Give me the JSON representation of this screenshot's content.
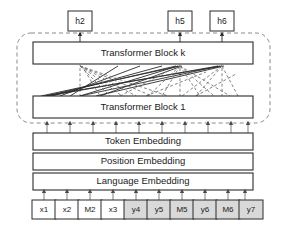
{
  "figure": {
    "background_color": "#ffffff"
  },
  "outputs": {
    "label_prefix": "h",
    "items": [
      {
        "label": "h2",
        "x": 80,
        "token_index": 2
      },
      {
        "label": "h5",
        "x": 180,
        "token_index": 5
      },
      {
        "label": "h6",
        "x": 222,
        "token_index": 8
      }
    ]
  },
  "transformer_stack": {
    "dashed_region_label": "",
    "top_block": {
      "label": "Transformer Block k"
    },
    "bottom_block": {
      "label": "Transformer Block 1"
    },
    "ellipsis_between": true
  },
  "embeddings": {
    "layers": [
      {
        "label": "Token Embedding"
      },
      {
        "label": "Position Embedding"
      },
      {
        "label": "Language Embedding"
      }
    ]
  },
  "input_tokens": {
    "count": 10,
    "items": [
      {
        "label": "x1",
        "shaded": false
      },
      {
        "label": "x2",
        "shaded": false
      },
      {
        "label": "M2",
        "shaded": false
      },
      {
        "label": "x3",
        "shaded": false
      },
      {
        "label": "y4",
        "shaded": true
      },
      {
        "label": "y5",
        "shaded": true
      },
      {
        "label": "M5",
        "shaded": true
      },
      {
        "label": "y6",
        "shaded": true
      },
      {
        "label": "M6",
        "shaded": true
      },
      {
        "label": "y7",
        "shaded": true
      }
    ]
  },
  "colors": {
    "shaded_token_fill": "#d9d9d9",
    "white_fill": "#ffffff",
    "stroke": "#2b2b2b",
    "dashed_stroke": "#8a8a8a",
    "attention_dashed": "#6f6f6f"
  }
}
